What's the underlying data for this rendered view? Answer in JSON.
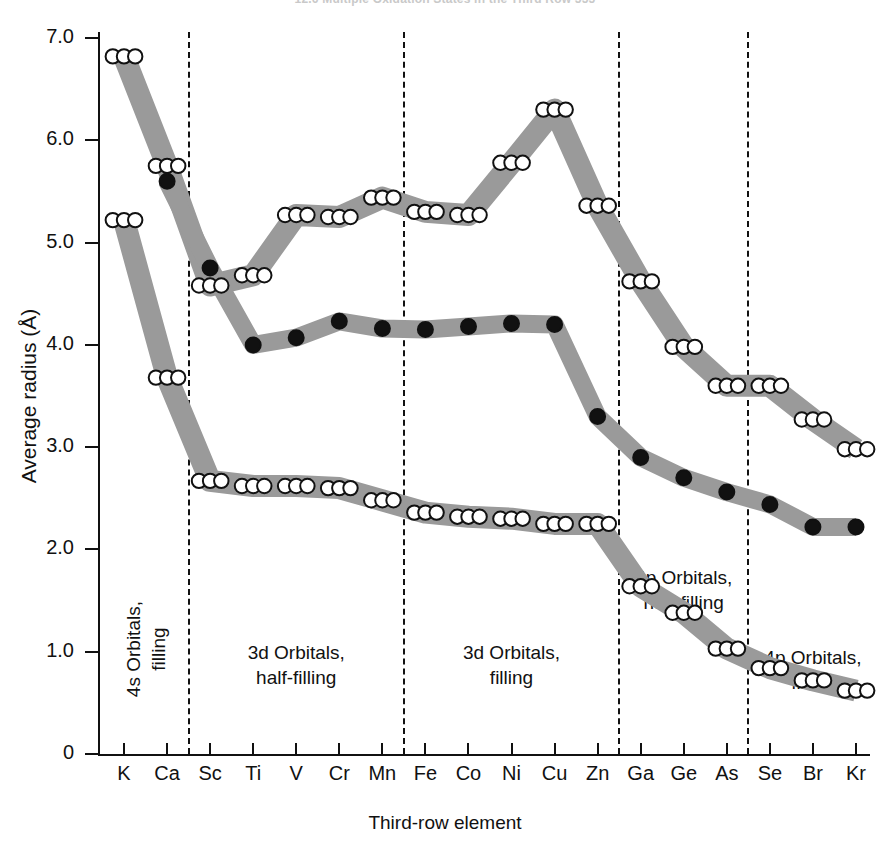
{
  "running_head": {
    "text": "12.6  Multiple Oxidation States in the Third Row    555"
  },
  "axes": {
    "y_title": "Average radius (Å)",
    "x_title": "Third-row element",
    "y_ticks": [
      "0",
      "1.0",
      "2.0",
      "3.0",
      "4.0",
      "5.0",
      "6.0",
      "7.0"
    ],
    "y_tick_values": [
      0,
      1.0,
      2.0,
      3.0,
      4.0,
      5.0,
      6.0,
      7.0
    ],
    "x_ticks": [
      "K",
      "Ca",
      "Sc",
      "Ti",
      "V",
      "Cr",
      "Mn",
      "Fe",
      "Co",
      "Ni",
      "Cu",
      "Zn",
      "Ga",
      "Ge",
      "As",
      "Se",
      "Br",
      "Kr"
    ]
  },
  "regions": [
    {
      "name": "4s-orbitals-filling",
      "label": "4s Orbitals,\nfilling",
      "orientation": "vertical",
      "start": "K",
      "end": "Ca"
    },
    {
      "name": "3d-orbitals-half-filling",
      "label": "3d Orbitals,\nhalf-filling",
      "orientation": "horizontal",
      "start": "Sc",
      "end": "Mn"
    },
    {
      "name": "3d-orbitals-filling",
      "label": "3d Orbitals,\nfilling",
      "orientation": "horizontal",
      "start": "Fe",
      "end": "Zn"
    },
    {
      "name": "4p-orbitals-half-filling",
      "label": "4p Orbitals,\nhalf-filling",
      "orientation": "horizontal",
      "start": "Ga",
      "end": "As"
    },
    {
      "name": "4p-orbitals-filling",
      "label": "4p Orbitals,\nfilling",
      "orientation": "horizontal",
      "start": "Se",
      "end": "Kr"
    }
  ],
  "dividers_after": [
    "Ca",
    "Mn",
    "Zn",
    "As"
  ],
  "colors": {
    "band": "#9a9a9a",
    "axis": "#111111",
    "marker_open_fill": "#ffffff",
    "marker_filled_fill": "#111111",
    "marker_stroke": "#111111"
  },
  "chart_data": {
    "type": "line",
    "title": "",
    "xlabel": "Third-row element",
    "ylabel": "Average radius (Å)",
    "ylim": [
      0,
      7.2
    ],
    "grid": false,
    "legend": "none",
    "categories": [
      "K",
      "Ca",
      "Sc",
      "Ti",
      "V",
      "Cr",
      "Mn",
      "Fe",
      "Co",
      "Ni",
      "Cu",
      "Zn",
      "Ga",
      "Ge",
      "As",
      "Se",
      "Br",
      "Kr"
    ],
    "series": [
      {
        "name": "outer orbital (ns/np) — upper band",
        "marker": "open-circle",
        "x": [
          "K",
          "Ca",
          "Sc",
          "Ti",
          "V",
          "Cr",
          "Mn",
          "Fe",
          "Co",
          "Ni",
          "Cu",
          "Zn",
          "Ga",
          "Ge",
          "As",
          "Se",
          "Br",
          "Kr"
        ],
        "values": [
          6.82,
          5.75,
          4.58,
          4.68,
          5.27,
          5.25,
          5.44,
          5.3,
          5.27,
          5.78,
          6.3,
          5.36,
          4.62,
          3.98,
          3.6,
          3.6,
          3.27,
          2.98
        ]
      },
      {
        "name": "outer orbital — lower edge of upper band",
        "marker": "open-circle",
        "x": [
          "K",
          "Ca",
          "Sc",
          "Ti",
          "V",
          "Cr",
          "Mn",
          "Fe",
          "Co",
          "Ni",
          "Cu",
          "Zn",
          "Ga",
          "Ge",
          "As",
          "Se",
          "Br",
          "Kr"
        ],
        "values": [
          5.22,
          3.68,
          2.67,
          2.62,
          2.62,
          2.6,
          2.48,
          2.36,
          2.32,
          2.3,
          2.25,
          2.25,
          1.64,
          1.38,
          1.03,
          0.84,
          0.72,
          0.62
        ]
      },
      {
        "name": "3d orbital — middle band",
        "marker": "filled-circle",
        "x": [
          "Ca",
          "Sc",
          "Ti",
          "V",
          "Cr",
          "Mn",
          "Fe",
          "Co",
          "Ni",
          "Cu",
          "Zn",
          "Ga",
          "Ge",
          "As",
          "Se",
          "Br",
          "Kr"
        ],
        "values": [
          5.6,
          4.75,
          4.0,
          4.07,
          4.23,
          4.16,
          4.15,
          4.18,
          4.21,
          4.2,
          3.3,
          2.9,
          2.7,
          2.56,
          2.44,
          2.22,
          2.22
        ]
      }
    ],
    "annotations": [
      "4s Orbitals, filling",
      "3d Orbitals, half-filling",
      "3d Orbitals, filling",
      "4p Orbitals, half-filling",
      "4p Orbitals, filling"
    ]
  }
}
